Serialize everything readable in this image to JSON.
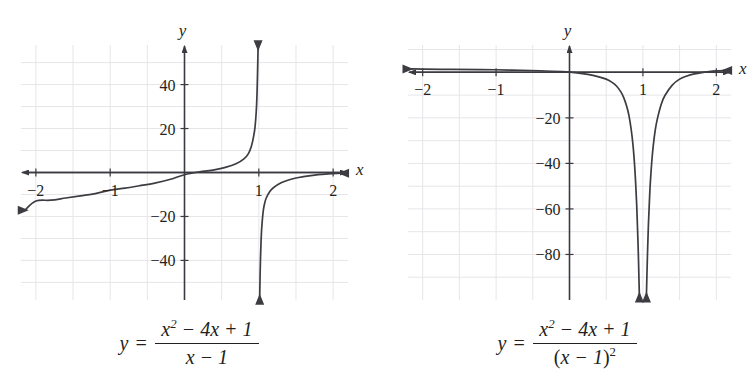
{
  "figures": [
    {
      "id": "figure-left",
      "caption": {
        "lhs": "y =",
        "numerator_plain": "x² − 4x + 1",
        "denominator_plain": "x − 1",
        "num_parts": {
          "x": "x",
          "exp": "2",
          "mid": "− 4",
          "x2": "x",
          "tail": "+ 1"
        },
        "den_parts": {
          "x": "x",
          "tail": "− 1"
        }
      },
      "chart_data": {
        "type": "line",
        "title": "",
        "function": "y = (x^2 - 4x + 1)/(x - 1)",
        "xlabel": "x",
        "ylabel": "y",
        "xlim": [
          -2.2,
          2.2
        ],
        "ylim": [
          -58,
          58
        ],
        "grid": true,
        "x_ticks": [
          -2,
          -1,
          1,
          2
        ],
        "x_tick_labels": [
          "−2",
          "−1",
          "1",
          "2"
        ],
        "y_ticks": [
          -40,
          -20,
          20,
          40
        ],
        "y_tick_labels": [
          "−40",
          "−20",
          "20",
          "40"
        ],
        "grid_x": [
          -2,
          -1.5,
          -1,
          -0.5,
          0,
          0.5,
          1,
          1.5,
          2
        ],
        "grid_y": [
          -50,
          -40,
          -30,
          -20,
          -10,
          0,
          10,
          20,
          30,
          40,
          50
        ],
        "vertical_asymptote": 1,
        "branches": [
          {
            "name": "left-branch",
            "direction": "up-at-asymptote",
            "points": [
              [
                -2.15,
                -17.2
              ],
              [
                -2.0,
                -13.0
              ],
              [
                -1.8,
                -12.6
              ],
              [
                -1.6,
                -11.6
              ],
              [
                -1.4,
                -10.6
              ],
              [
                -1.2,
                -9.6
              ],
              [
                -1.0,
                -8.0
              ],
              [
                -0.8,
                -7.1
              ],
              [
                -0.6,
                -6.0
              ],
              [
                -0.4,
                -4.8
              ],
              [
                -0.2,
                -3.2
              ],
              [
                0.0,
                -1.0
              ],
              [
                0.2,
                0.3
              ],
              [
                0.4,
                1.2
              ],
              [
                0.55,
                2.3
              ],
              [
                0.7,
                4.1
              ],
              [
                0.8,
                6.2
              ],
              [
                0.86,
                8.6
              ],
              [
                0.9,
                11.9
              ],
              [
                0.93,
                16.4
              ],
              [
                0.95,
                21.0
              ],
              [
                0.965,
                27.5
              ],
              [
                0.975,
                35.0
              ],
              [
                0.982,
                44.0
              ],
              [
                0.987,
                52.0
              ],
              [
                0.99,
                57.0
              ]
            ]
          },
          {
            "name": "right-branch",
            "direction": "down-at-asymptote",
            "points": [
              [
                1.012,
                -57.0
              ],
              [
                1.016,
                -49.0
              ],
              [
                1.022,
                -40.0
              ],
              [
                1.03,
                -31.5
              ],
              [
                1.04,
                -24.8
              ],
              [
                1.06,
                -17.4
              ],
              [
                1.08,
                -13.8
              ],
              [
                1.1,
                -11.6
              ],
              [
                1.15,
                -8.5
              ],
              [
                1.2,
                -6.8
              ],
              [
                1.3,
                -4.7
              ],
              [
                1.4,
                -3.4
              ],
              [
                1.5,
                -2.5
              ],
              [
                1.6,
                -1.9
              ],
              [
                1.7,
                -1.4
              ],
              [
                1.8,
                -1.0
              ],
              [
                1.9,
                -0.7
              ],
              [
                2.0,
                -0.5
              ],
              [
                2.12,
                -0.3
              ]
            ]
          }
        ],
        "arrows": [
          {
            "name": "x-axis-arrow-right",
            "at": [
              2.18,
              0
            ],
            "dir": "right"
          },
          {
            "name": "x-axis-arrow-left",
            "at": [
              -2.18,
              0
            ],
            "dir": "left"
          },
          {
            "name": "y-axis-arrow-up",
            "at": [
              0,
              58
            ],
            "dir": "up"
          },
          {
            "name": "curve-arrow-up",
            "at": [
              0.99,
              57
            ],
            "dir": "up"
          },
          {
            "name": "curve-arrow-down",
            "at": [
              1.012,
              -57
            ],
            "dir": "down"
          },
          {
            "name": "curve-arrow-left",
            "at": [
              -2.15,
              -17.2
            ],
            "dir": "left"
          },
          {
            "name": "curve-arrow-right",
            "at": [
              2.12,
              -0.3
            ],
            "dir": "right"
          }
        ]
      }
    },
    {
      "id": "figure-right",
      "caption": {
        "lhs": "y =",
        "numerator_plain": "x² − 4x + 1",
        "denominator_plain": "(x − 1)²",
        "num_parts": {
          "x": "x",
          "exp": "2",
          "mid": "− 4",
          "x2": "x",
          "tail": "+ 1"
        },
        "den_parts": {
          "open": "(",
          "x": "x",
          "tail": "− 1",
          "close": ")",
          "exp": "2"
        }
      },
      "chart_data": {
        "type": "line",
        "title": "",
        "function": "y = (x^2 - 4x + 1)/(x - 1)^2",
        "xlabel": "x",
        "ylabel": "y",
        "xlim": [
          -2.2,
          2.2
        ],
        "ylim": [
          -100,
          12
        ],
        "grid": true,
        "x_ticks": [
          -2,
          -1,
          1,
          2
        ],
        "x_tick_labels": [
          "−2",
          "−1",
          "1",
          "2"
        ],
        "y_ticks": [
          -80,
          -60,
          -40,
          -20
        ],
        "y_tick_labels": [
          "−80",
          "−60",
          "−40",
          "−20"
        ],
        "grid_x": [
          -2,
          -1.5,
          -1,
          -0.5,
          0,
          0.5,
          1,
          1.5,
          2
        ],
        "grid_y": [
          -90,
          -80,
          -70,
          -60,
          -50,
          -40,
          -30,
          -20,
          -10,
          0,
          10
        ],
        "vertical_asymptote": 1,
        "branches": [
          {
            "name": "left-branch",
            "direction": "down-at-asymptote",
            "points": [
              [
                -2.18,
                1.5
              ],
              [
                -2.0,
                1.4
              ],
              [
                -1.6,
                1.3
              ],
              [
                -1.2,
                1.2
              ],
              [
                -0.8,
                1.0
              ],
              [
                -0.4,
                0.7
              ],
              [
                -0.1,
                0.3
              ],
              [
                0.1,
                -0.2
              ],
              [
                0.25,
                -0.9
              ],
              [
                0.4,
                -2.0
              ],
              [
                0.5,
                -3.0
              ],
              [
                0.58,
                -4.4
              ],
              [
                0.64,
                -6.0
              ],
              [
                0.7,
                -8.6
              ],
              [
                0.74,
                -11.2
              ],
              [
                0.78,
                -15.0
              ],
              [
                0.81,
                -19.0
              ],
              [
                0.84,
                -25.0
              ],
              [
                0.865,
                -32.0
              ],
              [
                0.885,
                -40.0
              ],
              [
                0.9,
                -48.0
              ],
              [
                0.915,
                -58.0
              ],
              [
                0.928,
                -70.0
              ],
              [
                0.938,
                -80.0
              ],
              [
                0.947,
                -92.0
              ],
              [
                0.952,
                -98.0
              ]
            ]
          },
          {
            "name": "right-branch",
            "direction": "down-at-asymptote",
            "points": [
              [
                1.048,
                -98.0
              ],
              [
                1.054,
                -90.0
              ],
              [
                1.064,
                -78.0
              ],
              [
                1.075,
                -67.0
              ],
              [
                1.088,
                -57.0
              ],
              [
                1.1,
                -49.0
              ],
              [
                1.12,
                -39.5
              ],
              [
                1.14,
                -32.5
              ],
              [
                1.17,
                -25.0
              ],
              [
                1.2,
                -20.0
              ],
              [
                1.25,
                -14.0
              ],
              [
                1.3,
                -10.2
              ],
              [
                1.4,
                -5.6
              ],
              [
                1.5,
                -3.0
              ],
              [
                1.6,
                -1.6
              ],
              [
                1.7,
                -0.7
              ],
              [
                1.8,
                -0.1
              ],
              [
                1.9,
                0.3
              ],
              [
                2.0,
                0.6
              ],
              [
                2.12,
                0.8
              ]
            ]
          }
        ],
        "arrows": [
          {
            "name": "x-axis-arrow-right",
            "at": [
              2.18,
              0
            ],
            "dir": "right"
          },
          {
            "name": "x-axis-arrow-left",
            "at": [
              -2.18,
              0
            ],
            "dir": "left"
          },
          {
            "name": "y-axis-arrow-up",
            "at": [
              0,
              12
            ],
            "dir": "up"
          },
          {
            "name": "curve-arrow-down-left",
            "at": [
              0.952,
              -98
            ],
            "dir": "down"
          },
          {
            "name": "curve-arrow-down-right",
            "at": [
              1.048,
              -98
            ],
            "dir": "down"
          },
          {
            "name": "curve-arrow-left",
            "at": [
              -2.18,
              1.5
            ],
            "dir": "left"
          },
          {
            "name": "curve-arrow-right",
            "at": [
              2.12,
              0.8
            ],
            "dir": "right"
          }
        ]
      }
    }
  ],
  "colors": {
    "curve": "#3c3c42",
    "axis": "#3a3a40",
    "grid": "#e6e6ea",
    "text": "#231f20",
    "background": "#ffffff"
  }
}
